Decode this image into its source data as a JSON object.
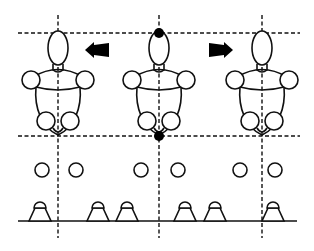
{
  "diagram": {
    "colors": {
      "stroke": "#111111",
      "background": "#ffffff",
      "marker": "#000000"
    },
    "guides": {
      "top_y": 33,
      "bottom_y": 136,
      "h_x_start": 18,
      "h_x_end": 300,
      "verticals_x": [
        58,
        159,
        262
      ],
      "vertical_y_start": 15,
      "vertical_y_end": 238
    },
    "figures": [
      {
        "id": "left",
        "cx": 58,
        "markers": false
      },
      {
        "id": "center",
        "cx": 159,
        "markers": true
      },
      {
        "id": "right",
        "cx": 262,
        "markers": false
      }
    ],
    "arrows": [
      {
        "direction": "left",
        "x": 85,
        "y": 50
      },
      {
        "direction": "right",
        "x": 209,
        "y": 50
      }
    ],
    "target_circles": {
      "y": 170,
      "r": 7,
      "x": [
        42,
        76,
        141,
        178,
        240,
        275
      ]
    },
    "ground": {
      "y": 221,
      "x_start": 18,
      "x_end": 297
    },
    "shuttles": {
      "base_y": 221,
      "x": [
        40,
        98,
        127,
        185,
        215,
        273
      ]
    }
  }
}
